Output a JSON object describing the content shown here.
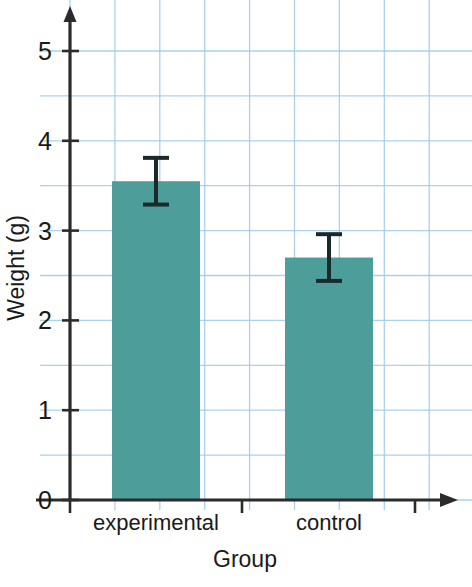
{
  "chart_data": {
    "type": "bar",
    "title": "",
    "subtitle": "",
    "xlabel": "Group",
    "ylabel": "Weight (g)",
    "categories": [
      "experimental",
      "control"
    ],
    "values": [
      3.55,
      2.7
    ],
    "errors": [
      0.26,
      0.26
    ],
    "error_bars": [
      {
        "category": "experimental",
        "lower": 3.29,
        "upper": 3.81
      },
      {
        "category": "control",
        "lower": 2.44,
        "upper": 2.96
      }
    ],
    "ylim": [
      0,
      5.45
    ],
    "xlim": [
      0,
      2
    ],
    "yticks": [
      0,
      1,
      2,
      3,
      4,
      5
    ],
    "ytick_labels": [
      "0",
      "1",
      "2",
      "3",
      "4",
      "5"
    ],
    "ytick_minor_step": 0.5,
    "grid": "graph-paper",
    "grid_color": "#9ecbe8",
    "grid_minor_spacing_units": 0.5,
    "legend": "none",
    "legend_position": "none",
    "bar_color": "#4d9d9b",
    "axis_color": "#2b2b2b",
    "error_bar_color": "#1a2a2a",
    "annotations": []
  },
  "axes": {
    "y_arrow": "arrow-up",
    "x_arrow": "arrow-right"
  }
}
